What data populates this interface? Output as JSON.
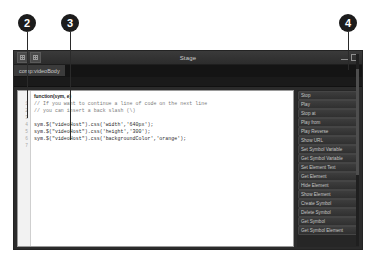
{
  "callouts": [
    {
      "label": "2",
      "x": 27,
      "y": 14,
      "line_height": 86
    },
    {
      "label": "3",
      "x": 70,
      "y": 14,
      "line_height": 108
    },
    {
      "label": "4",
      "x": 348,
      "y": 14,
      "line_height": 38
    }
  ],
  "window": {
    "title": "Stage",
    "left_buttons": [
      {
        "name": "panel-grid-button-1"
      },
      {
        "name": "panel-grid-button-2"
      }
    ],
    "right_buttons": [
      {
        "name": "minimize-button"
      },
      {
        "name": "maximize-button"
      }
    ],
    "tab": {
      "label": "comp:videoBody"
    }
  },
  "editor": {
    "function_header": "function(sym, e)",
    "gutter_numbers": [
      "1",
      "2",
      "3",
      "4",
      "5",
      "6",
      "7"
    ],
    "lines": [
      {
        "text": "// If you want to continue a line of code on the next line",
        "type": "comment"
      },
      {
        "text": "// you can insert a back slash (\\)",
        "type": "comment"
      },
      {
        "text": "",
        "type": "code"
      },
      {
        "text": "sym.$(\"videoHost\").css('width','640px');",
        "type": "code"
      },
      {
        "text": "sym.$(\"videoHost\").css('height','300');",
        "type": "code"
      },
      {
        "text": "sym.$(\"videoHost\").css('backgroundColor','orange');",
        "type": "code"
      },
      {
        "text": "",
        "type": "code"
      }
    ]
  },
  "snippets": {
    "buttons": [
      "Stop",
      "Play",
      "Stop at",
      "Play from",
      "Play Reverse",
      "Show URL",
      "Set Symbol Variable",
      "Get Symbol Variable",
      "Set Element Text",
      "Get Element",
      "Hide Element",
      "Show Element",
      "Create Symbol",
      "Delete Symbol",
      "Get Symbol",
      "Get Symbol Element"
    ]
  },
  "colors": {
    "page_background": "#ffffff",
    "window_chrome": "#2b2b2b",
    "titlebar": "#3a3a3a",
    "tab_active": "#3b3b3b",
    "editor_background": "#ffffff",
    "comment_text": "#7a7a7a",
    "callout_badge": "#1c1c1c"
  }
}
